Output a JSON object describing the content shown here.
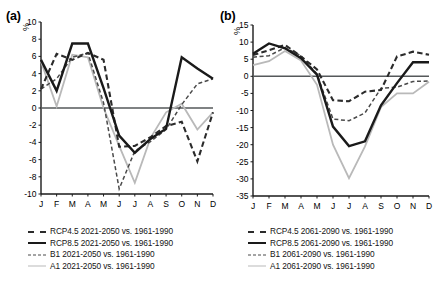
{
  "figure": {
    "panels": [
      {
        "id": "a",
        "label": "(a)",
        "unit_label": "%"
      },
      {
        "id": "b",
        "label": "(b)",
        "unit_label": "%"
      }
    ]
  },
  "chart_data": [
    {
      "type": "line",
      "title": "(a)",
      "xlabel": "",
      "ylabel": "%",
      "categories": [
        "J",
        "F",
        "M",
        "A",
        "M",
        "J",
        "J",
        "A",
        "S",
        "O",
        "N",
        "D"
      ],
      "xtick_labels": [
        "J",
        "F",
        "M",
        "A",
        "M",
        "J",
        "J",
        "A",
        "S",
        "O",
        "N",
        "D"
      ],
      "ytick_labels": [
        "10",
        "8",
        "6",
        "4",
        "2",
        "0",
        "-2",
        "-4",
        "-6",
        "-8",
        "-10"
      ],
      "ylim": [
        -10,
        10
      ],
      "ytick_values": [
        10,
        8,
        6,
        4,
        2,
        0,
        -2,
        -4,
        -6,
        -8,
        -10
      ],
      "grid": false,
      "zero_line": true,
      "legend_position": "below",
      "series": [
        {
          "name": "RCP4.5 2021-2050 vs. 1961-1990",
          "style": "dashed-thick",
          "color": "#2b2b2b",
          "values": [
            2.2,
            6.3,
            5.6,
            6.4,
            5.6,
            -4.5,
            -4.4,
            -3.4,
            -2.1,
            -1.6,
            -6.2,
            -0.5
          ]
        },
        {
          "name": "RCP8.5 2021-2050 vs. 1961-1990",
          "style": "solid-thick",
          "color": "#1a1a1a",
          "values": [
            5.6,
            2.0,
            7.5,
            7.5,
            2.3,
            -3.2,
            -5.2,
            -3.6,
            -2.4,
            5.9,
            4.6,
            3.4
          ]
        },
        {
          "name": "B1 2021-2050 vs. 1961-1990",
          "style": "dashed-thin",
          "color": "#4a4a4a",
          "values": [
            2.2,
            3.4,
            5.9,
            6.4,
            0.6,
            -9.4,
            -5.0,
            -3.9,
            -2.5,
            0.4,
            2.8,
            3.4
          ]
        },
        {
          "name": "A1 2021-2050 vs. 1961-1990",
          "style": "solid-thin",
          "color": "#b9b9b9",
          "values": [
            5.4,
            0.2,
            6.2,
            5.9,
            0.0,
            -4.4,
            -8.7,
            -3.5,
            -0.5,
            0.5,
            -2.5,
            -0.5
          ]
        }
      ]
    },
    {
      "type": "line",
      "title": "(b)",
      "xlabel": "",
      "ylabel": "%",
      "categories": [
        "J",
        "F",
        "M",
        "A",
        "M",
        "J",
        "J",
        "A",
        "S",
        "O",
        "N",
        "D"
      ],
      "xtick_labels": [
        "J",
        "F",
        "M",
        "A",
        "M",
        "J",
        "J",
        "A",
        "S",
        "O",
        "N",
        "D"
      ],
      "ytick_labels": [
        "15",
        "10",
        "5",
        "0",
        "-5",
        "-10",
        "-15",
        "-20",
        "-25",
        "-30",
        "-35"
      ],
      "ylim": [
        -35,
        15
      ],
      "ytick_values": [
        15,
        10,
        5,
        0,
        -5,
        -10,
        -15,
        -20,
        -25,
        -30,
        -35
      ],
      "grid": false,
      "zero_line": true,
      "legend_position": "below",
      "series": [
        {
          "name": "RCP4.5 2061-2090 vs. 1961-1990",
          "style": "dashed-thick",
          "color": "#2b2b2b",
          "values": [
            6.2,
            7.6,
            9.2,
            5.8,
            2.0,
            -7.0,
            -7.3,
            -4.5,
            -4.0,
            5.8,
            7.2,
            6.3
          ]
        },
        {
          "name": "RCP8.5 2061-2090 vs. 1961-1990",
          "style": "solid-thick",
          "color": "#1a1a1a",
          "values": [
            6.6,
            9.6,
            8.2,
            5.3,
            0.5,
            -14.7,
            -20.4,
            -19.0,
            -8.5,
            -2.0,
            4.1,
            4.1
          ]
        },
        {
          "name": "B1 2061-2090 vs. 1961-1990",
          "style": "dashed-thin",
          "color": "#4a4a4a",
          "values": [
            5.6,
            6.0,
            8.4,
            6.0,
            0.6,
            -12.5,
            -13.0,
            -10.7,
            -3.5,
            -3.2,
            -1.5,
            -1.4
          ]
        },
        {
          "name": "A1 2061-2090 vs. 1961-1990",
          "style": "solid-thin",
          "color": "#b9b9b9",
          "values": [
            3.3,
            4.4,
            7.4,
            4.6,
            -2.5,
            -20.0,
            -29.8,
            -20.5,
            -9.0,
            -5.0,
            -5.0,
            -1.6
          ]
        }
      ]
    }
  ],
  "legends": {
    "panel_a": [
      {
        "label": "RCP4.5 2021-2050 vs. 1961-1990",
        "style": "dashed-thick"
      },
      {
        "label": "RCP8.5 2021-2050 vs. 1961-1990",
        "style": "solid-thick"
      },
      {
        "label": "B1 2021-2050 vs. 1961-1990",
        "style": "dashed-thin"
      },
      {
        "label": "A1 2021-2050 vs. 1961-1990",
        "style": "solid-thin"
      }
    ],
    "panel_b": [
      {
        "label": "RCP4.5 2061-2090 vs. 1961-1990",
        "style": "dashed-thick"
      },
      {
        "label": "RCP8.5 2061-2090 vs. 1961-1990",
        "style": "solid-thick"
      },
      {
        "label": "B1 2061-2090 vs. 1961-1990",
        "style": "dashed-thin"
      },
      {
        "label": "A1 2061-2090 vs. 1961-1990",
        "style": "solid-thin"
      }
    ]
  }
}
